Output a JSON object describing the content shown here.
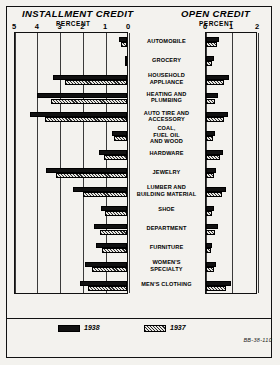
{
  "figure": {
    "left_panel_title": "INSTALLMENT CREDIT",
    "right_panel_title": "OPEN CREDIT",
    "left_axis_unit": "PERCENT",
    "right_axis_unit": "PERCENT",
    "plate_number": "BB-38-110"
  },
  "legend": {
    "series1_label": "1938",
    "series2_label": "1937",
    "series1_color": "#111111",
    "series2_color": "hatched"
  },
  "chart_data": {
    "type": "bar",
    "orientation": "horizontal",
    "xlabel": "PERCENT",
    "ylabel": "",
    "grid": true,
    "legend_position": "bottom",
    "panels": [
      {
        "name": "INSTALLMENT CREDIT",
        "unit": "PERCENT",
        "direction": "left",
        "ticks": [
          5,
          4,
          3,
          2,
          1,
          0
        ],
        "xlim": [
          0,
          5
        ]
      },
      {
        "name": "OPEN CREDIT",
        "unit": "PERCENT",
        "direction": "right",
        "ticks": [
          0,
          1,
          2
        ],
        "xlim": [
          0,
          2
        ]
      }
    ],
    "categories": [
      "AUTOMOBILE",
      "GROCERY",
      "HOUSEHOLD APPLIANCE",
      "HEATING AND PLUMBING",
      "AUTO TIRE AND ACCESSORY",
      "COAL, FUEL OIL AND WOOD",
      "HARDWARE",
      "JEWELRY",
      "LUMBER AND BUILDING MATERIAL",
      "SHOE",
      "DEPARTMENT",
      "FURNITURE",
      "WOMEN'S SPECIALTY",
      "MEN'S CLOTHING"
    ],
    "series": [
      {
        "name": "1938",
        "panel": "INSTALLMENT CREDIT",
        "values": [
          0.35,
          0.05,
          3.25,
          3.95,
          4.25,
          0.65,
          1.25,
          3.55,
          2.35,
          1.15,
          1.45,
          1.35,
          1.85,
          2.05
        ]
      },
      {
        "name": "1937",
        "panel": "INSTALLMENT CREDIT",
        "values": [
          0.25,
          0.04,
          2.7,
          3.35,
          3.6,
          0.55,
          1.0,
          3.1,
          1.95,
          0.95,
          1.2,
          1.1,
          1.55,
          1.7
        ]
      },
      {
        "name": "1938",
        "panel": "OPEN CREDIT",
        "values": [
          0.5,
          0.3,
          0.9,
          0.45,
          0.85,
          0.35,
          0.65,
          0.4,
          0.75,
          0.3,
          0.45,
          0.22,
          0.38,
          0.95
        ]
      },
      {
        "name": "1937",
        "panel": "OPEN CREDIT",
        "values": [
          0.42,
          0.24,
          0.7,
          0.36,
          0.68,
          0.28,
          0.52,
          0.32,
          0.6,
          0.24,
          0.36,
          0.18,
          0.3,
          0.78
        ]
      }
    ]
  }
}
